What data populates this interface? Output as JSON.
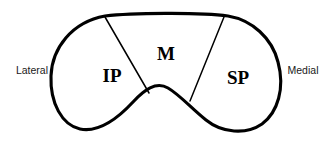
{
  "figure": {
    "background_color": "#ffffff",
    "stroke_color": "#000000",
    "width": 331,
    "height": 145
  },
  "orientation_labels": {
    "left": "Lateral",
    "right": "Medial"
  },
  "regions": [
    {
      "id": "ip",
      "label": "IP"
    },
    {
      "id": "m",
      "label": "M"
    },
    {
      "id": "sp",
      "label": "SP"
    }
  ]
}
